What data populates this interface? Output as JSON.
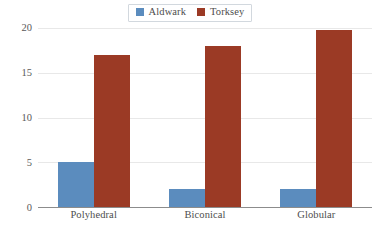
{
  "chart_data": {
    "type": "bar",
    "title": "",
    "subtitle": "",
    "xlabel": "",
    "ylabel": "",
    "categories": [
      "Polyhedral",
      "Biconical",
      "Globular"
    ],
    "series": [
      {
        "name": "Aldwark",
        "color": "#5b8cbe",
        "values": [
          5,
          2,
          2
        ]
      },
      {
        "name": "Torksey",
        "color": "#9b3a25",
        "values": [
          17,
          18,
          19.8
        ]
      }
    ],
    "ylim": [
      0,
      20
    ],
    "yticks": [
      0,
      5,
      10,
      15,
      20
    ],
    "ytick_labels": [
      "0",
      "5",
      "10",
      "15",
      "20"
    ],
    "grid": "horizontal",
    "legend_position": "top-center",
    "legend_entries": [
      "Aldwark",
      "Torksey"
    ],
    "axis_color": "#8c8c8c",
    "gridline_color": "#e8e8e8",
    "text_color": "#4d4d4d",
    "background": "#ffffff"
  }
}
